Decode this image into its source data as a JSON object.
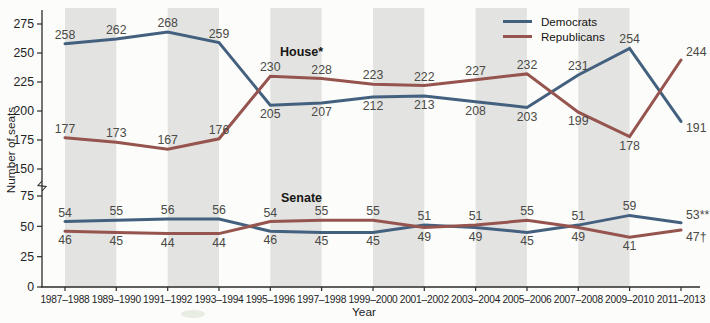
{
  "figure": {
    "y_axis_label": "Number of seats",
    "x_axis_label": "Year",
    "house_label": "House*",
    "senate_label": "Senate",
    "legend": [
      {
        "label": "Democrats",
        "color": "#44607f"
      },
      {
        "label": "Republicans",
        "color": "#96544e"
      }
    ],
    "band_color": "#e3e3e1",
    "axis_color": "#2b2b29",
    "y_ticks_upper": [
      275,
      250,
      225,
      200,
      175,
      150
    ],
    "y_ticks_lower": [
      75,
      50,
      25,
      0
    ]
  },
  "chart_data": {
    "type": "line",
    "title": "",
    "xlabel": "Year",
    "ylabel": "Number of seats",
    "x": [
      "1987–1988",
      "1989–1990",
      "1991–1992",
      "1993–1994",
      "1995–1996",
      "1997–1998",
      "1999–2000",
      "2001–2002",
      "2003–2004",
      "2005–2006",
      "2007–2008",
      "2009–2010",
      "2011–2013"
    ],
    "y_axis_break_between": [
      75,
      150
    ],
    "ylim_upper_segment": [
      150,
      280
    ],
    "ylim_lower_segment": [
      0,
      75
    ],
    "shaded_band_pairs": [
      [
        0,
        1
      ],
      [
        2,
        3
      ],
      [
        4,
        5
      ],
      [
        6,
        7
      ],
      [
        8,
        9
      ],
      [
        10,
        11
      ]
    ],
    "series": [
      {
        "name": "Democrats",
        "chamber": "House",
        "color": "#44607f",
        "values": [
          258,
          262,
          268,
          259,
          205,
          207,
          212,
          213,
          208,
          203,
          231,
          254,
          191
        ],
        "label_pos": [
          "above",
          "above",
          "above",
          "above",
          "below",
          "below",
          "below",
          "below",
          "below",
          "below",
          "above",
          "above",
          "below"
        ]
      },
      {
        "name": "Republicans",
        "chamber": "House",
        "color": "#96544e",
        "values": [
          177,
          173,
          167,
          176,
          230,
          228,
          223,
          222,
          227,
          232,
          199,
          178,
          244
        ],
        "label_pos": [
          "above",
          "above",
          "above",
          "above",
          "above",
          "above",
          "above",
          "above",
          "above",
          "above",
          "below",
          "below",
          "above"
        ]
      },
      {
        "name": "Democrats",
        "chamber": "Senate",
        "color": "#44607f",
        "values": [
          54,
          55,
          56,
          56,
          46,
          45,
          45,
          51,
          49,
          45,
          51,
          59,
          53
        ],
        "point_labels": [
          null,
          null,
          null,
          null,
          null,
          null,
          null,
          null,
          null,
          null,
          null,
          null,
          "53**"
        ],
        "label_pos": [
          "above",
          "above",
          "above",
          "above",
          "below",
          "below",
          "below",
          "above",
          "below",
          "below",
          "above",
          "above",
          "above"
        ]
      },
      {
        "name": "Republicans",
        "chamber": "Senate",
        "color": "#96544e",
        "values": [
          46,
          45,
          44,
          44,
          54,
          55,
          55,
          49,
          51,
          55,
          49,
          41,
          47
        ],
        "point_labels": [
          null,
          null,
          null,
          null,
          null,
          null,
          null,
          null,
          null,
          null,
          null,
          null,
          "47†"
        ],
        "label_pos": [
          "below",
          "below",
          "below",
          "below",
          "above",
          "above",
          "above",
          "below",
          "above",
          "above",
          "below",
          "below",
          "below"
        ]
      }
    ]
  }
}
